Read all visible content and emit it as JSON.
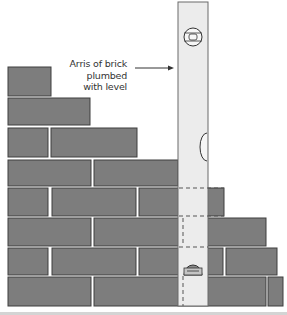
{
  "diagram": {
    "annotation": {
      "lines": [
        "Arris of brick",
        "plumbed",
        "with level"
      ],
      "target": "spirit-level edge"
    },
    "colors": {
      "brick": "#7d7d7d",
      "brick_outline": "#3e3e3e",
      "mortar": "#d0d0d0",
      "level_body": "#ececec",
      "level_outline": "#6a6a6a",
      "text": "#333333",
      "background": "#ffffff"
    },
    "components": [
      "stepped brick wall (8 courses)",
      "spirit level held vertically",
      "top vial",
      "side vial",
      "bottom vial",
      "dashed hidden lines"
    ]
  }
}
